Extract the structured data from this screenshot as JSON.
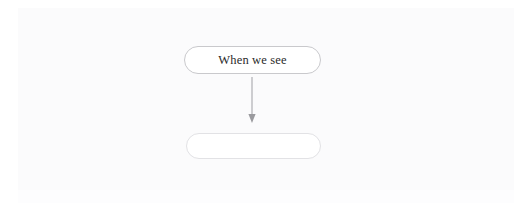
{
  "diagram": {
    "type": "flowchart",
    "background_color": "#fbfbfc",
    "nodes": [
      {
        "id": "node-top",
        "label": "When we see",
        "shape": "pill",
        "border_color": "#c9c9cc",
        "fill_color": "#ffffff",
        "text_color": "#2b2b2b"
      },
      {
        "id": "node-bottom",
        "label": "",
        "shape": "pill",
        "border_color": "#e2e2e5",
        "fill_color": "#ffffff",
        "text_color": "#8a8a8a"
      }
    ],
    "connectors": [
      {
        "id": "connector-top-to-bottom",
        "from": "node-top",
        "to": "node-bottom",
        "direction": "down",
        "style": "solid",
        "color": "#b4b4b8",
        "arrowhead": "filled-triangle"
      }
    ]
  }
}
